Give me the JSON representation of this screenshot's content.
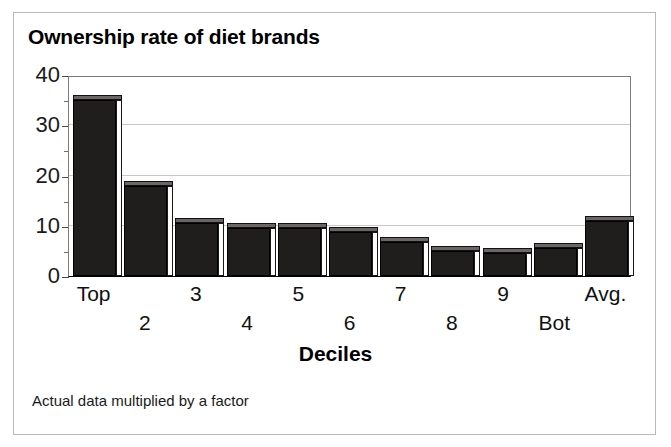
{
  "figure": {
    "title": "Ownership rate of diet brands",
    "footnote": "Actual data multiplied by a factor"
  },
  "chart_data": {
    "type": "bar",
    "title": "Ownership rate of diet brands",
    "xlabel": "Deciles",
    "ylabel": "",
    "categories": [
      "Top",
      "2",
      "3",
      "4",
      "5",
      "6",
      "7",
      "8",
      "9",
      "Bot",
      "Avg."
    ],
    "values": [
      35,
      18,
      10.5,
      9.5,
      9.5,
      8.8,
      6.8,
      5,
      4.5,
      5.5,
      11
    ],
    "ylim": [
      0,
      40
    ],
    "yticks": [
      0,
      10,
      20,
      30,
      40
    ],
    "ytick_labels": [
      "0",
      "10",
      "20",
      "30",
      "40"
    ],
    "gridlines": [
      10,
      20,
      30
    ],
    "grid": true,
    "legend": "none",
    "bar_color": "#201d1d",
    "grid_color": "#c8c8c8",
    "annotation": "Actual data multiplied by a factor"
  },
  "axis": {
    "x_title": "Deciles"
  }
}
